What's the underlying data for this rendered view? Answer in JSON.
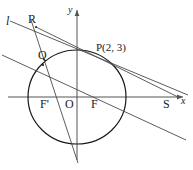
{
  "figure": {
    "type": "euclidean-geometry-diagram",
    "stroke_color": "#1a1a1a",
    "axis_color": "#555555",
    "line_color": "#4a4a4a",
    "background": "#ffffff",
    "width": 193,
    "height": 170
  },
  "axes": {
    "x_label": "x",
    "y_label": "y",
    "origin_label": "O"
  },
  "points": [
    {
      "id": "R",
      "label": "R",
      "x": 36,
      "y": 27
    },
    {
      "id": "Q",
      "label": "Q",
      "x": 43,
      "y": 65
    },
    {
      "id": "P",
      "label": "P(2, 3)",
      "x": 112,
      "y": 52
    },
    {
      "id": "F2",
      "label": "F'",
      "x": 45,
      "y": 97
    },
    {
      "id": "O",
      "label": "O",
      "x": 70,
      "y": 97
    },
    {
      "id": "F",
      "label": "F",
      "x": 96,
      "y": 97
    },
    {
      "id": "S",
      "label": "S",
      "x": 167,
      "y": 97
    }
  ],
  "lines": [
    {
      "id": "l",
      "label": "l",
      "description": "line l from upper left through R descending to the right"
    },
    {
      "id": "RS",
      "label": "",
      "description": "steep line through R and Q continuing to the bottom"
    },
    {
      "id": "QS",
      "label": "",
      "description": "line through Q descending to the lower right"
    }
  ],
  "ellipse": {
    "cx": 77,
    "cy": 97,
    "rx": 49,
    "ry": 47
  }
}
